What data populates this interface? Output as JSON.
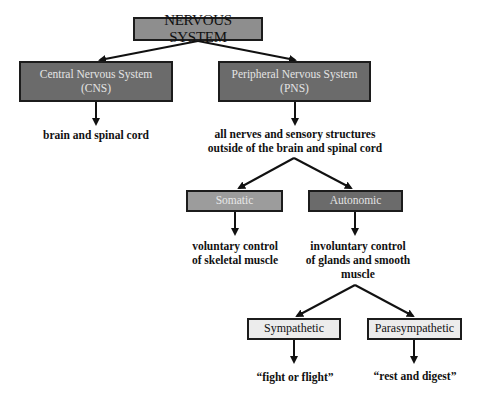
{
  "diagram": {
    "root": {
      "label": "NERVOUS SYSTEM"
    },
    "cns": {
      "line1": "Central Nervous System",
      "line2": "(CNS)",
      "description": "brain and spinal cord"
    },
    "pns": {
      "line1": "Peripheral Nervous System",
      "line2": "(PNS)",
      "description_line1": "all nerves and sensory structures",
      "description_line2": "outside of the brain and spinal cord"
    },
    "somatic": {
      "label": "Somatic",
      "description_line1": "voluntary control",
      "description_line2": "of skeletal muscle"
    },
    "autonomic": {
      "label": "Autonomic",
      "description_line1": "involuntary control",
      "description_line2": "of glands and smooth muscle"
    },
    "sympathetic": {
      "label": "Sympathetic",
      "description": "“fight or flight”"
    },
    "parasympathetic": {
      "label": "Parasympathetic",
      "description": "“rest and digest”"
    }
  }
}
